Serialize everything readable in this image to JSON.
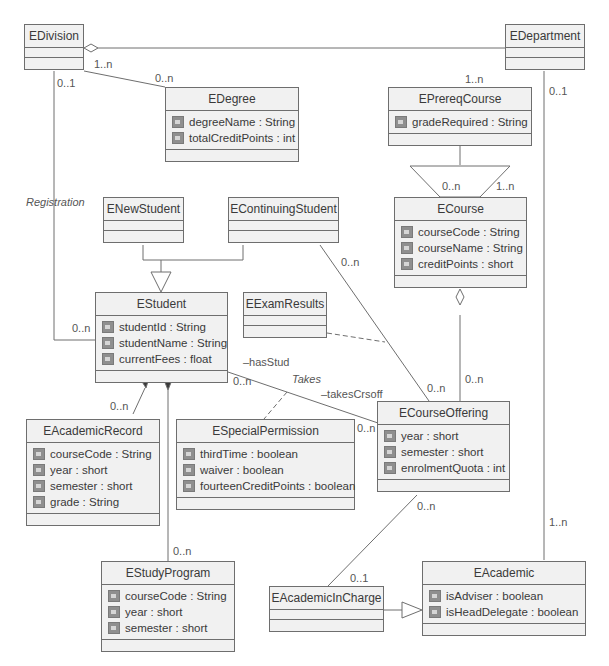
{
  "classes": {
    "division": {
      "name": "EDivision",
      "attributes": []
    },
    "department": {
      "name": "EDepartment",
      "attributes": []
    },
    "degree": {
      "name": "EDegree",
      "attributes": [
        "degreeName : String",
        "totalCreditPoints : int"
      ]
    },
    "prereq_course": {
      "name": "EPrereqCourse",
      "attributes": [
        "gradeRequired : String"
      ]
    },
    "new_student": {
      "name": "ENewStudent",
      "attributes": []
    },
    "continuing_student": {
      "name": "EContinuingStudent",
      "attributes": []
    },
    "course": {
      "name": "ECourse",
      "attributes": [
        "courseCode : String",
        "courseName : String",
        "creditPoints : short"
      ]
    },
    "student": {
      "name": "EStudent",
      "attributes": [
        "studentId : String",
        "studentName : String",
        "currentFees : float"
      ]
    },
    "exam_results": {
      "name": "EExamResults",
      "attributes": []
    },
    "academic_record": {
      "name": "EAcademicRecord",
      "attributes": [
        "courseCode : String",
        "year : short",
        "semester : short",
        "grade : String"
      ]
    },
    "special_permission": {
      "name": "ESpecialPermission",
      "attributes": [
        "thirdTime : boolean",
        "waiver : boolean",
        "fourteenCreditPoints : boolean"
      ]
    },
    "course_offering": {
      "name": "ECourseOffering",
      "attributes": [
        "year : short",
        "semester : short",
        "enrolmentQuota : int"
      ]
    },
    "study_program": {
      "name": "EStudyProgram",
      "attributes": [
        "courseCode : String",
        "year : short",
        "semester : short"
      ]
    },
    "academic_in_charge": {
      "name": "EAcademicInCharge",
      "attributes": []
    },
    "academic": {
      "name": "EAcademic",
      "attributes": [
        "isAdviser : boolean",
        "isHeadDelegate : boolean"
      ]
    }
  },
  "labels": {
    "div_degree_src": "1..n",
    "div_degree_dst": "0..n",
    "div_student_src": "0..1",
    "registration": "Registration",
    "student_registration": "0..n",
    "prereq_top": "1..n",
    "prereq_left": "0..n",
    "prereq_right": "1..n",
    "dept_src": "0..1",
    "dept_academic": "1..n",
    "cont_offering": "0..n",
    "offering_cont": "0..n",
    "course_offering": "0..n",
    "has_stud": "–hasStud",
    "takes": "Takes",
    "takes_crs_off": "–takesCrsoff",
    "student_takes": "0..n",
    "offering_takes": "0..n",
    "academic_record_mult": "0..n",
    "study_program_mult": "0..n",
    "offering_incharge": "0..n",
    "incharge_mult": "0..1"
  },
  "colors": {
    "line": "#6e6e6e",
    "box_fill": "#f1f1f1",
    "icon": "#8f8f8f"
  }
}
